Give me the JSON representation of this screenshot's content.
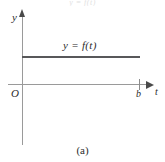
{
  "figure": {
    "caption": "(a)",
    "top_clipped_text": "y = f(t)",
    "axes": {
      "y_axis_label": "y",
      "t_axis_label": "t",
      "origin_label": "O"
    },
    "ticks": {
      "t_axis": [
        {
          "label": "b",
          "position_px": 139
        }
      ]
    },
    "curve_label": "y = f(t)"
  },
  "chart_data": {
    "type": "line",
    "title": "",
    "subtitle": "",
    "xlabel": "t",
    "ylabel": "y",
    "grid": false,
    "legend": null,
    "xlim": [
      0,
      1.0
    ],
    "ylim": [
      0,
      1.0
    ],
    "xticks": [
      0,
      0.9
    ],
    "xticklabels": [
      "O",
      "b"
    ],
    "yticks": [],
    "yticklabels": [],
    "annotations": [
      {
        "text": "y = f(t)",
        "x": 0.45,
        "y": 0.42,
        "style": "italic"
      },
      {
        "text": "(a)",
        "x": 0.5,
        "y": -0.35,
        "style": "caption"
      }
    ],
    "series": [
      {
        "name": "y = f(t)",
        "style": "solid",
        "color": "#58585a",
        "linewidth": 2,
        "comment": "constant (horizontal) function from t=0 to t=b",
        "x": [
          0.0,
          0.9
        ],
        "y": [
          0.33,
          0.33
        ]
      }
    ]
  }
}
